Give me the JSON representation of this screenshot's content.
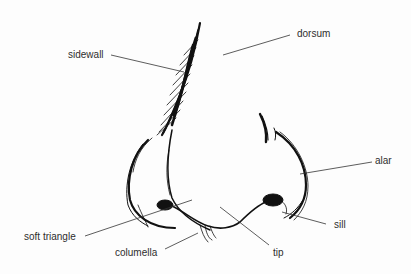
{
  "figure": {
    "labels": {
      "sidewall": "sidewall",
      "dorsum": "dorsum",
      "alar": "alar",
      "soft_triangle": "soft triangle",
      "sill": "sill",
      "columella": "columella",
      "tip": "tip"
    }
  },
  "colors": {
    "ink": "#111111",
    "leader_line": "#333333",
    "text": "#2e2e2e"
  }
}
